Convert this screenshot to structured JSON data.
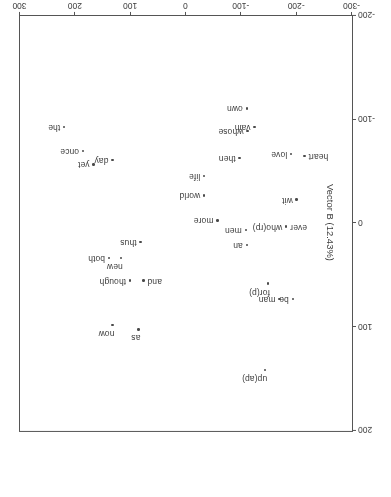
{
  "chart_data": {
    "type": "scatter",
    "title": "",
    "xlabel": "Vector A (26.25%)",
    "ylabel": "Vector B (12.43%)",
    "xlim": [
      -300,
      300
    ],
    "ylim": [
      -200,
      200
    ],
    "xticks": [
      -300,
      -200,
      -100,
      0,
      100,
      200,
      300
    ],
    "yticks": [
      -200,
      -100,
      0,
      100,
      200
    ],
    "grid": false,
    "legend": "none",
    "points": [
      {
        "label": "up(ap)",
        "x": -143,
        "y": 141,
        "place": "above"
      },
      {
        "label": "as",
        "x": 86,
        "y": 102,
        "place": "above"
      },
      {
        "label": "now",
        "x": 133,
        "y": 98,
        "place": "above"
      },
      {
        "label": "be",
        "x": -193,
        "y": 73,
        "place": "right"
      },
      {
        "label": "man",
        "x": -169,
        "y": 73,
        "place": "right"
      },
      {
        "label": "for(p)",
        "x": -148,
        "y": 58,
        "place": "above"
      },
      {
        "label": "and",
        "x": 77,
        "y": 55,
        "place": "left"
      },
      {
        "label": "though",
        "x": 101,
        "y": 55,
        "place": "right"
      },
      {
        "label": "new",
        "x": 118,
        "y": 33,
        "place": "above"
      },
      {
        "label": "both",
        "x": 139,
        "y": 33,
        "place": "right"
      },
      {
        "label": "thus",
        "x": 82,
        "y": 18,
        "place": "right"
      },
      {
        "label": "an",
        "x": -110,
        "y": 21,
        "place": "right"
      },
      {
        "label": "men",
        "x": -108,
        "y": 6,
        "place": "right"
      },
      {
        "label": "who(rp)",
        "x": -181,
        "y": 3,
        "place": "right"
      },
      {
        "label": "ever",
        "x": -181,
        "y": 3,
        "place": "left"
      },
      {
        "label": "more",
        "x": -57,
        "y": -3,
        "place": "right"
      },
      {
        "label": "wit",
        "x": -200,
        "y": -23,
        "place": "right"
      },
      {
        "label": "world",
        "x": -33,
        "y": -27,
        "place": "right"
      },
      {
        "label": "life",
        "x": -33,
        "y": -46,
        "place": "right"
      },
      {
        "label": "day",
        "x": 133,
        "y": -61,
        "place": "right"
      },
      {
        "label": "yet",
        "x": 167,
        "y": -57,
        "place": "right"
      },
      {
        "label": "heart",
        "x": -214,
        "y": -65,
        "place": "left"
      },
      {
        "label": "then",
        "x": -97,
        "y": -63,
        "place": "right"
      },
      {
        "label": "love",
        "x": -190,
        "y": -67,
        "place": "right"
      },
      {
        "label": "once",
        "x": 186,
        "y": -70,
        "place": "right"
      },
      {
        "label": "whose",
        "x": -111,
        "y": -89,
        "place": "right"
      },
      {
        "label": "vain",
        "x": -124,
        "y": -93,
        "place": "right"
      },
      {
        "label": "the",
        "x": 220,
        "y": -93,
        "place": "right"
      },
      {
        "label": "own",
        "x": -110,
        "y": -111,
        "place": "right"
      }
    ]
  }
}
